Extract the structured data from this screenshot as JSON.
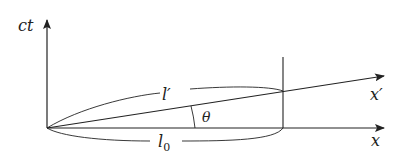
{
  "diagram": {
    "labels": {
      "time_axis": "ct",
      "x_axis": "x",
      "x_prime_axis": "x′",
      "moving_length": "l′",
      "rest_length": "l",
      "rest_length_sub": "0",
      "angle": "θ"
    },
    "colors": {
      "stroke": "#222222",
      "background": "#ffffff"
    }
  }
}
